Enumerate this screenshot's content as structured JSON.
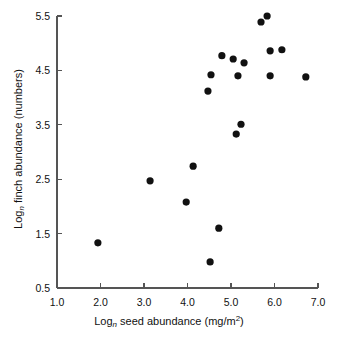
{
  "chart_data": {
    "type": "scatter",
    "title": "",
    "xlabel": "Log_n seed abundance (mg/m2)",
    "ylabel": "Log_n finch abundance (numbers)",
    "xlabel_parts": {
      "prefix": "Log",
      "sub": "n",
      "middle": " seed abundance (mg/m",
      "sup": "2",
      "suffix": ")"
    },
    "ylabel_parts": {
      "prefix": "Log",
      "sub": "n",
      "suffix": " finch abundance (numbers)"
    },
    "xlim": [
      1.0,
      7.0
    ],
    "ylim": [
      0.5,
      5.5
    ],
    "xticks": [
      "1.0",
      "2.0",
      "3.0",
      "4.0",
      "5.0",
      "6.0",
      "7.0"
    ],
    "yticks": [
      "5.5",
      "4.5",
      "3.5",
      "2.5",
      "1.5",
      "0.5"
    ],
    "xtick_values": [
      1.0,
      2.0,
      3.0,
      4.0,
      5.0,
      6.0,
      7.0
    ],
    "ytick_values": [
      5.5,
      4.5,
      3.5,
      2.5,
      1.5,
      0.5
    ],
    "grid": false,
    "legend": false,
    "marker": "filled-circle",
    "marker_color": "#111111",
    "marker_radius": 3.6,
    "axis_color": "#555555",
    "points": [
      {
        "x": 1.94,
        "y": 1.33
      },
      {
        "x": 3.14,
        "y": 2.47
      },
      {
        "x": 3.97,
        "y": 2.08
      },
      {
        "x": 4.13,
        "y": 2.74
      },
      {
        "x": 4.47,
        "y": 4.12
      },
      {
        "x": 4.52,
        "y": 0.98
      },
      {
        "x": 4.54,
        "y": 4.42
      },
      {
        "x": 4.72,
        "y": 1.6
      },
      {
        "x": 4.79,
        "y": 4.77
      },
      {
        "x": 5.05,
        "y": 4.71
      },
      {
        "x": 5.12,
        "y": 3.33
      },
      {
        "x": 5.16,
        "y": 4.4
      },
      {
        "x": 5.23,
        "y": 3.51
      },
      {
        "x": 5.3,
        "y": 4.64
      },
      {
        "x": 5.69,
        "y": 5.39
      },
      {
        "x": 5.83,
        "y": 5.5
      },
      {
        "x": 5.9,
        "y": 4.4
      },
      {
        "x": 5.9,
        "y": 4.86
      },
      {
        "x": 6.17,
        "y": 4.88
      },
      {
        "x": 6.72,
        "y": 4.38
      }
    ]
  },
  "geometry": {
    "plot_left": 57,
    "plot_right": 318,
    "plot_top": 16,
    "plot_bottom": 288
  }
}
